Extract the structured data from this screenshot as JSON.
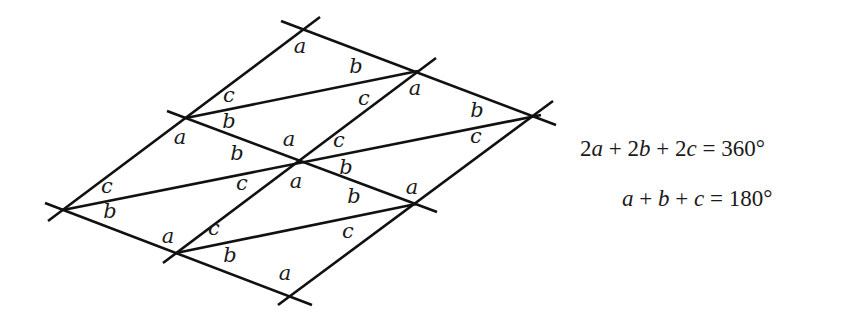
{
  "diagram": {
    "line_color": "#111111",
    "vertices": {
      "T": [
        304,
        30
      ],
      "U": [
        418,
        71
      ],
      "R": [
        541,
        115
      ],
      "L1": [
        186,
        118
      ],
      "C": [
        297,
        160
      ],
      "M": [
        416,
        204
      ],
      "L0": [
        63,
        210
      ],
      "B1": [
        176,
        253
      ],
      "B": [
        290,
        296
      ]
    },
    "lines": [
      {
        "name": "upper-transversal",
        "from": [
          281,
          21
        ],
        "to": [
          556,
          125
        ]
      },
      {
        "name": "middle-transversal",
        "from": [
          167,
          111
        ],
        "to": [
          437,
          212
        ]
      },
      {
        "name": "lower-transversal",
        "from": [
          45,
          203
        ],
        "to": [
          312,
          305
        ]
      },
      {
        "name": "left-parallel",
        "from": [
          48,
          221
        ],
        "to": [
          320,
          17
        ]
      },
      {
        "name": "center-parallel",
        "from": [
          163,
          263
        ],
        "to": [
          436,
          58
        ]
      },
      {
        "name": "right-parallel",
        "from": [
          278,
          305
        ],
        "to": [
          553,
          101
        ]
      },
      {
        "name": "upper-diagonal",
        "from": [
          186,
          118
        ],
        "to": [
          418,
          71
        ]
      },
      {
        "name": "middle-diagonal",
        "from": [
          63,
          210
        ],
        "to": [
          541,
          115
        ]
      },
      {
        "name": "lower-diagonal",
        "from": [
          176,
          253
        ],
        "to": [
          416,
          204
        ]
      }
    ],
    "angle_labels": [
      {
        "text": "a",
        "x": 300,
        "y": 53
      },
      {
        "text": "b",
        "x": 356,
        "y": 73
      },
      {
        "text": "c",
        "x": 229,
        "y": 102
      },
      {
        "text": "c",
        "x": 364,
        "y": 105
      },
      {
        "text": "a",
        "x": 415,
        "y": 95
      },
      {
        "text": "b",
        "x": 229,
        "y": 128
      },
      {
        "text": "a",
        "x": 180,
        "y": 144
      },
      {
        "text": "b",
        "x": 477,
        "y": 117
      },
      {
        "text": "c",
        "x": 476,
        "y": 143
      },
      {
        "text": "b",
        "x": 237,
        "y": 160
      },
      {
        "text": "a",
        "x": 289,
        "y": 146
      },
      {
        "text": "c",
        "x": 339,
        "y": 147
      },
      {
        "text": "b",
        "x": 346,
        "y": 174
      },
      {
        "text": "a",
        "x": 296,
        "y": 188
      },
      {
        "text": "c",
        "x": 107,
        "y": 193
      },
      {
        "text": "c",
        "x": 242,
        "y": 190
      },
      {
        "text": "b",
        "x": 110,
        "y": 218
      },
      {
        "text": "b",
        "x": 354,
        "y": 203
      },
      {
        "text": "a",
        "x": 412,
        "y": 194
      },
      {
        "text": "c",
        "x": 214,
        "y": 235
      },
      {
        "text": "a",
        "x": 168,
        "y": 243
      },
      {
        "text": "c",
        "x": 348,
        "y": 238
      },
      {
        "text": "b",
        "x": 230,
        "y": 262
      },
      {
        "text": "a",
        "x": 285,
        "y": 280
      }
    ]
  },
  "equations": {
    "line1": {
      "c1": "2",
      "v1": "a",
      "op1": " + ",
      "c2": "2",
      "v2": "b",
      "op2": " + ",
      "c3": "2",
      "v3": "c",
      "eq": " = ",
      "rhs": "360°"
    },
    "line2": {
      "v1": "a",
      "op1": " + ",
      "v2": "b",
      "op2": " + ",
      "v3": "c",
      "eq": " = ",
      "rhs": "180°"
    }
  }
}
